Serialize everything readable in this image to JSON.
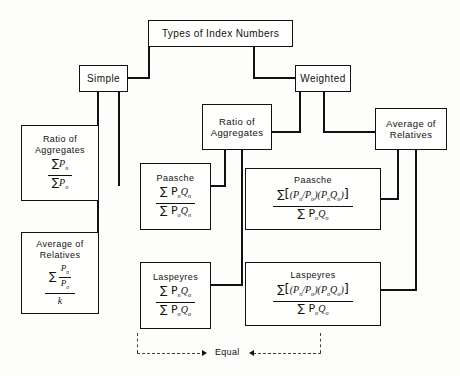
{
  "diagram": {
    "title_box": {
      "label": "Types of Index Numbers"
    },
    "branches": {
      "simple": {
        "label": "Simple"
      },
      "weighted": {
        "label": "Weighted"
      }
    },
    "categories": {
      "simple_ratio": {
        "label": "Ratio of\nAggregates"
      },
      "simple_average": {
        "label": "Average of\nRelatives"
      },
      "weighted_ratio": {
        "label": "Ratio of\nAggregates"
      },
      "weighted_average": {
        "label": "Average of\nRelatives"
      }
    },
    "formulas": {
      "simple_ratio_aggregates": {
        "title": "Ratio of\nAggregates",
        "numerator_sum": "∑",
        "numerator": "P",
        "numerator_sub": "n",
        "denominator_sum": "∑",
        "denominator": "P",
        "denominator_sub": "o"
      },
      "simple_average_relatives": {
        "title": "Average of\nRelatives",
        "sum": "∑",
        "inner_num": "P",
        "inner_num_sub": "n",
        "inner_den": "P",
        "inner_den_sub": "o",
        "denominator": "k"
      },
      "weighted_ratio_paasche": {
        "title": "Paasche",
        "numerator": "∑ P",
        "numerator_sub1": "n",
        "numerator_q": "Q",
        "numerator_sub2": "n",
        "denominator": "∑ P",
        "denominator_sub1": "o",
        "denominator_q": "Q",
        "denominator_sub2": "n"
      },
      "weighted_ratio_laspeyres": {
        "title": "Laspeyres",
        "numerator": "∑ P",
        "numerator_sub1": "n",
        "numerator_q": "Q",
        "numerator_sub2": "o",
        "denominator": "∑ P",
        "denominator_sub1": "o",
        "denominator_q": "Q",
        "denominator_sub2": "o"
      },
      "weighted_average_paasche": {
        "title": "Paasche",
        "sum": "∑",
        "ratio_num": "P",
        "ratio_num_sub": "n",
        "ratio_den": "P",
        "ratio_den_sub": "o",
        "weight_p": "P",
        "weight_p_sub": "n",
        "weight_q": "Q",
        "weight_q_sub": "n",
        "denominator": "∑ P",
        "denominator_sub1": "n",
        "denominator_q": "Q",
        "denominator_sub2": "n"
      },
      "weighted_average_laspeyres": {
        "title": "Laspeyres",
        "sum": "∑",
        "ratio_num": "P",
        "ratio_num_sub": "n",
        "ratio_den": "P",
        "ratio_den_sub": "o",
        "weight_p": "P",
        "weight_p_sub": "o",
        "weight_q": "Q",
        "weight_q_sub": "o",
        "denominator": "∑ P",
        "denominator_sub1": "o",
        "denominator_q": "Q",
        "denominator_sub2": "o"
      }
    },
    "annotations": {
      "equal_label": "Equal"
    }
  }
}
